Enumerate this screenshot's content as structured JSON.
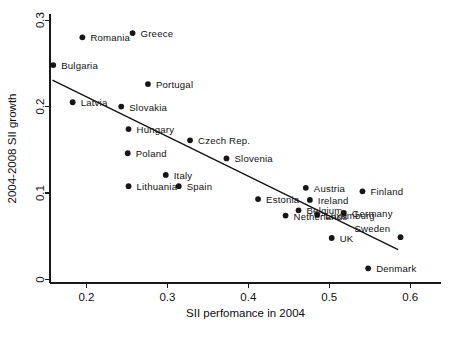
{
  "chart_data": {
    "type": "scatter",
    "title": "",
    "xlabel": "SII perfomance in 2004",
    "ylabel": "2004-2008 SII growth",
    "xlim": [
      0.155,
      0.638
    ],
    "ylim": [
      -0.004,
      0.307
    ],
    "xticks": [
      0.2,
      0.3,
      0.4,
      0.5,
      0.6
    ],
    "xticklabels": [
      "0.2",
      "0.3",
      "0.4",
      "0.5",
      "0.6"
    ],
    "yticks": [
      0,
      0.1,
      0.2,
      0.3
    ],
    "yticklabels": [
      "0",
      "0.1",
      "0.2",
      "0.3"
    ],
    "grid": false,
    "legend": false,
    "points": [
      {
        "label": "Romania",
        "x": 0.195,
        "y": 0.28,
        "lx": 8,
        "ly": -4
      },
      {
        "label": "Greece",
        "x": 0.257,
        "y": 0.285,
        "lx": 8,
        "ly": -4
      },
      {
        "label": "Bulgaria",
        "x": 0.159,
        "y": 0.248,
        "lx": 8,
        "ly": -4
      },
      {
        "label": "Portugal",
        "x": 0.276,
        "y": 0.226,
        "lx": 8,
        "ly": -4
      },
      {
        "label": "Latvia",
        "x": 0.183,
        "y": 0.205,
        "lx": 8,
        "ly": -4
      },
      {
        "label": "Slovakia",
        "x": 0.243,
        "y": 0.2,
        "lx": 8,
        "ly": -4
      },
      {
        "label": "Hungary",
        "x": 0.252,
        "y": 0.174,
        "lx": 8,
        "ly": -4
      },
      {
        "label": "Czech Rep.",
        "x": 0.328,
        "y": 0.161,
        "lx": 8,
        "ly": -4
      },
      {
        "label": "Poland",
        "x": 0.251,
        "y": 0.146,
        "lx": 8,
        "ly": -4
      },
      {
        "label": "Slovenia",
        "x": 0.373,
        "y": 0.14,
        "lx": 8,
        "ly": -4
      },
      {
        "label": "Italy",
        "x": 0.298,
        "y": 0.121,
        "lx": 8,
        "ly": -4
      },
      {
        "label": "Lithuania",
        "x": 0.252,
        "y": 0.108,
        "lx": 8,
        "ly": -4
      },
      {
        "label": "Spain",
        "x": 0.314,
        "y": 0.108,
        "lx": 8,
        "ly": -4
      },
      {
        "label": "Austria",
        "x": 0.471,
        "y": 0.106,
        "lx": 8,
        "ly": -4
      },
      {
        "label": "Finland",
        "x": 0.541,
        "y": 0.102,
        "lx": 8,
        "ly": -4
      },
      {
        "label": "Estonia",
        "x": 0.412,
        "y": 0.093,
        "lx": 8,
        "ly": -4
      },
      {
        "label": "Ireland",
        "x": 0.476,
        "y": 0.092,
        "lx": 8,
        "ly": -4
      },
      {
        "label": "Belgium",
        "x": 0.462,
        "y": 0.08,
        "lx": 8,
        "ly": -4
      },
      {
        "label": "Luxemburg",
        "x": 0.485,
        "y": 0.075,
        "lx": 8,
        "ly": -4
      },
      {
        "label": "Netherlands",
        "x": 0.446,
        "y": 0.074,
        "lx": 8,
        "ly": -4
      },
      {
        "label": "Germany",
        "x": 0.518,
        "y": 0.077,
        "lx": 8,
        "ly": -4
      },
      {
        "label": "UK",
        "x": 0.503,
        "y": 0.048,
        "lx": 8,
        "ly": -4
      },
      {
        "label": "Sweden",
        "x": 0.588,
        "y": 0.049,
        "lx": -46,
        "ly": -13
      },
      {
        "label": "Denmark",
        "x": 0.548,
        "y": 0.013,
        "lx": 8,
        "ly": -4
      }
    ],
    "fit_line": {
      "name": "linear fit",
      "x1": 0.158,
      "y1": 0.2305,
      "x2": 0.585,
      "y2": 0.0345
    }
  }
}
